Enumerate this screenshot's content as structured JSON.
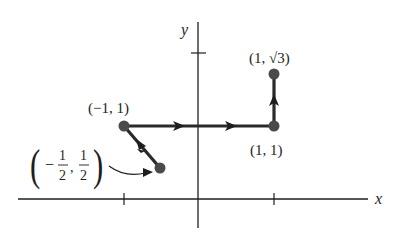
{
  "diagram": {
    "axes": {
      "x_label": "x",
      "y_label": "y"
    },
    "points": [
      {
        "id": "p-half",
        "label": "(−1/2, 1/2)",
        "label_num1": "1",
        "label_den1": "2",
        "label_num2": "1",
        "label_den2": "2",
        "x": -0.5,
        "y": 0.5
      },
      {
        "id": "p-neg1-1",
        "label": "(−1, 1)",
        "x": -1,
        "y": 1
      },
      {
        "id": "p-1-1",
        "label": "(1, 1)",
        "x": 1,
        "y": 1
      },
      {
        "id": "p-1-sqrt3",
        "label": "(1, √3)",
        "x": 1,
        "y": 1.732
      }
    ],
    "path_order": [
      "(−1/2, 1/2)",
      "(−1, 1)",
      "(1, 1)",
      "(1, √3)"
    ],
    "colors": {
      "axis": "#1e1e1e",
      "path": "#2a2a2a",
      "point": "#4a4a4a"
    }
  }
}
